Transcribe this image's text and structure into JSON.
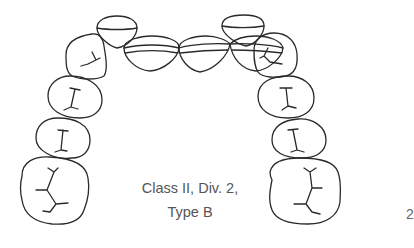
{
  "figure": {
    "caption_line1": "Class II, Div. 2,",
    "caption_line2": "Type B",
    "page_number": "2",
    "stroke_color": "#2a2a2a",
    "caption_color": "#555555"
  },
  "teeth": {
    "left": [
      "canine",
      "lateral-incisor",
      "central-incisor",
      "first-premolar",
      "second-premolar",
      "first-molar",
      "second-molar"
    ],
    "right": [
      "central-incisor",
      "lateral-incisor",
      "canine",
      "first-premolar",
      "second-premolar",
      "first-molar",
      "second-molar"
    ]
  }
}
